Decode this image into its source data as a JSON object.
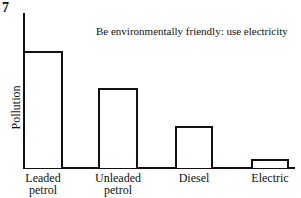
{
  "figure_number": "7",
  "chart_data": {
    "type": "bar",
    "title": "",
    "annotation": "Be environmentally friendly: use electricity",
    "xlabel": "",
    "ylabel": "Pollution",
    "categories": [
      "Leaded petrol",
      "Unleaded petrol",
      "Diesel",
      "Electric"
    ],
    "category_lines": [
      [
        "Leaded",
        "petrol"
      ],
      [
        "Unleaded",
        "petrol"
      ],
      [
        "Diesel",
        ""
      ],
      [
        "Electric",
        ""
      ]
    ],
    "values": [
      5.3,
      3.6,
      1.9,
      0.4
    ],
    "ylim": [
      0,
      7
    ],
    "grid": false,
    "legend": null,
    "bar_style": {
      "fill": "#ffffff",
      "stroke": "#111111"
    }
  }
}
